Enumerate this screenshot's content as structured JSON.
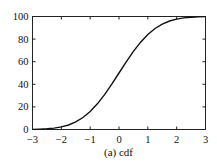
{
  "chart_data": {
    "type": "line",
    "title": "",
    "caption": "(a) cdf",
    "xlabel": "",
    "ylabel": "",
    "xlim": [
      -3,
      3
    ],
    "ylim": [
      0,
      100
    ],
    "xticks": [
      -3,
      -2,
      -1,
      0,
      1,
      2,
      3
    ],
    "yticks": [
      0,
      20,
      40,
      60,
      80,
      100
    ],
    "grid": false,
    "legend": null,
    "series": [
      {
        "name": "cdf",
        "color": "#111111",
        "x": [
          -3.0,
          -2.75,
          -2.5,
          -2.25,
          -2.0,
          -1.75,
          -1.5,
          -1.25,
          -1.0,
          -0.75,
          -0.5,
          -0.25,
          0.0,
          0.25,
          0.5,
          0.75,
          1.0,
          1.25,
          1.5,
          1.75,
          2.0,
          2.25,
          2.5,
          2.75,
          3.0
        ],
        "y": [
          0.1,
          0.3,
          0.6,
          1.2,
          2.3,
          4.0,
          6.7,
          10.6,
          15.9,
          22.7,
          30.9,
          40.1,
          50.0,
          59.9,
          69.1,
          77.3,
          84.1,
          89.4,
          93.3,
          96.0,
          97.7,
          98.8,
          99.4,
          99.7,
          99.9
        ]
      }
    ]
  }
}
